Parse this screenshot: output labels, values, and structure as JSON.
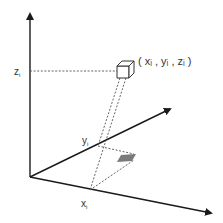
{
  "diagram": {
    "type": "3d-coordinate-projection",
    "axes": {
      "z": {
        "label": "Z"
      },
      "y": {
        "label": "Y"
      },
      "x": {
        "label": "X"
      }
    },
    "labels": {
      "z_label": "z",
      "z_sub": "i",
      "y_label": "y",
      "y_sub": "i",
      "x_label": "x",
      "x_sub": "i",
      "point_label": "( xᵢ , yᵢ , zᵢ )"
    },
    "colors": {
      "axis": "#1a1a1a",
      "dashed": "#555555",
      "shadow": "#7a7a7a",
      "cube": "#333333"
    }
  }
}
